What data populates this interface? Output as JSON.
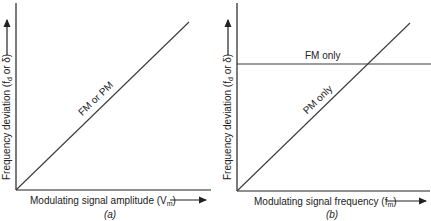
{
  "panels": [
    {
      "id": "a",
      "caption": "(a)",
      "xlabel": "Modulating signal amplitude (V",
      "xlabel_sub": "m",
      "xlabel_close": ")",
      "ylabel": "Frequency deviation (f",
      "ylabel_sub": "d",
      "ylabel_close": " or δ)",
      "lines": [
        {
          "label": "FM or PM",
          "type": "proportional"
        }
      ]
    },
    {
      "id": "b",
      "caption": "(b)",
      "xlabel": "Modulating signal frequency (f",
      "xlabel_sub": "m",
      "xlabel_close": ")",
      "ylabel": "Frequency deviation (f",
      "ylabel_sub": "d",
      "ylabel_close": " or δ)",
      "lines": [
        {
          "label": "FM only",
          "type": "constant"
        },
        {
          "label": "PM only",
          "type": "proportional"
        }
      ]
    }
  ],
  "colors": {
    "axis": "#222222",
    "line": "#3a3a3a",
    "background": "#ffffff"
  }
}
